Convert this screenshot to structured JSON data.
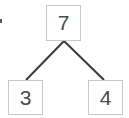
{
  "diagram": {
    "kind": "binary-tree",
    "width": 129,
    "height": 118,
    "background_color": "#ffffff",
    "node_border_color": "#c8c8c8",
    "node_fill_color": "#ffffff",
    "node_text_color": "#4a4a4a",
    "edge_color": "#3a3a3a",
    "edge_width": 2,
    "nodes": [
      {
        "id": "root",
        "label": "7",
        "role": "root",
        "x": 46,
        "y": 5,
        "width": 35,
        "height": 36
      },
      {
        "id": "left",
        "label": "3",
        "role": "left-child",
        "x": 8,
        "y": 80,
        "width": 35,
        "height": 35
      },
      {
        "id": "right",
        "label": "4",
        "role": "right-child",
        "x": 88,
        "y": 80,
        "width": 35,
        "height": 35
      }
    ],
    "edges": [
      {
        "id": "root-to-left",
        "from": "root",
        "to": "left",
        "x1": 64,
        "y1": 41,
        "x2": 26,
        "y2": 80
      },
      {
        "id": "root-to-right",
        "from": "root",
        "to": "right",
        "x1": 64,
        "y1": 41,
        "x2": 104,
        "y2": 80
      }
    ],
    "artifact": {
      "id": "left-edge-mark",
      "x": 0,
      "y": 19,
      "width": 2,
      "height": 4,
      "color": "#5a5a5a"
    }
  }
}
